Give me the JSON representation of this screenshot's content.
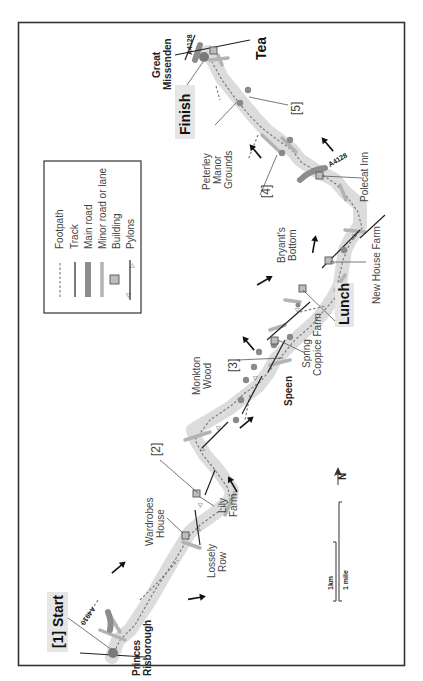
{
  "map": {
    "orientation": "rotated 90 degrees clockwise (north points left)",
    "legend": {
      "items": [
        {
          "symbol": "footpath",
          "label": "Footpath"
        },
        {
          "symbol": "track",
          "label": "Track"
        },
        {
          "symbol": "main-road",
          "label": "Main road"
        },
        {
          "symbol": "minor-road",
          "label": "Minor road or lane"
        },
        {
          "symbol": "building",
          "label": "Building"
        },
        {
          "symbol": "pylons",
          "label": "Pylons"
        }
      ]
    },
    "waypoints": {
      "start": "[1] Start",
      "wp2": "[2]",
      "wp3": "[3]",
      "wp4": "[4]",
      "wp5": "[5]",
      "lunch": "Lunch",
      "tea": "Tea",
      "finish": "Finish"
    },
    "places": {
      "princes_risborough_1": "Princes",
      "princes_risborough_2": "Risborough",
      "great_missenden_1": "Great",
      "great_missenden_2": "Missenden",
      "speen": "Speen"
    },
    "features": {
      "wardrobes_house_1": "Wardrobes",
      "wardrobes_house_2": "House",
      "lossely_row_1": "Lossely",
      "lossely_row_2": "Row",
      "lily_farm_1": "Lily",
      "lily_farm_2": "Farm",
      "monkton_wood_1": "Monkton",
      "monkton_wood_2": "Wood",
      "spring_coppice_1": "Spring",
      "spring_coppice_2": "Coppice Farm",
      "bryants_bottom_1": "Bryant's",
      "bryants_bottom_2": "Bottom",
      "new_house_farm": "New House Farm",
      "polecat_inn": "Polecat Inn",
      "peterley_1": "Peterley",
      "peterley_2": "Manor",
      "peterley_3": "Grounds"
    },
    "roads": {
      "a4010": "A4010",
      "a4128_polecat": "A4128",
      "a4128_missenden": "A4128"
    },
    "scale": {
      "km": "1km",
      "mile": "1 mile"
    },
    "north": "N",
    "colors": {
      "route_highlight": "#dcdcdc",
      "main_road": "#8c8c8c",
      "minor_road": "#b3b3b3",
      "building": "#bdbdbd",
      "tree": "#8a8a8a",
      "frame": "#333333"
    }
  }
}
